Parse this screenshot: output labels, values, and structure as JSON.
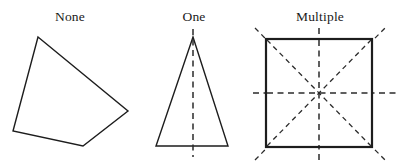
{
  "figure": {
    "title_row": [
      "None",
      "One",
      "Multiple"
    ],
    "background_color": "#ffffff",
    "stroke_color": "#1d1d1d",
    "dash_color": "#2b2b2b",
    "panels": [
      {
        "id": "none",
        "label": "None",
        "label_x": 70,
        "label_y": 21,
        "shape": "irregular-quadrilateral",
        "symmetry_lines": 0,
        "vertices": [
          [
            38,
            37
          ],
          [
            128,
            111
          ],
          [
            83,
            146
          ],
          [
            13,
            131
          ]
        ],
        "polygon_points": "38,37 128,111 83,146 13,131"
      },
      {
        "id": "one",
        "label": "One",
        "label_x": 194,
        "label_y": 21,
        "shape": "isosceles-triangle",
        "symmetry_lines": 1,
        "vertices": [
          [
            193,
            37
          ],
          [
            228,
            146
          ],
          [
            156,
            146
          ]
        ],
        "polygon_points": "193,37 228,146 156,146",
        "axes": [
          {
            "name": "vertical-axis",
            "x1": 193,
            "y1": 29,
            "x2": 193,
            "y2": 157
          }
        ]
      },
      {
        "id": "multiple",
        "label": "Multiple",
        "label_x": 320,
        "label_y": 21,
        "shape": "square",
        "symmetry_lines": 4,
        "rect": {
          "x": 266,
          "y": 39,
          "width": 106,
          "height": 108
        },
        "center": [
          319,
          93
        ],
        "axes": [
          {
            "name": "vertical-axis",
            "x1": 319,
            "y1": 28,
            "x2": 319,
            "y2": 160
          },
          {
            "name": "horizontal-axis",
            "x1": 253,
            "y1": 93,
            "x2": 398,
            "y2": 93
          },
          {
            "name": "diagonal-axis-nwse",
            "x1": 255,
            "y1": 28,
            "x2": 385,
            "y2": 160
          },
          {
            "name": "diagonal-axis-swne",
            "x1": 255,
            "y1": 160,
            "x2": 385,
            "y2": 28
          }
        ]
      }
    ]
  }
}
